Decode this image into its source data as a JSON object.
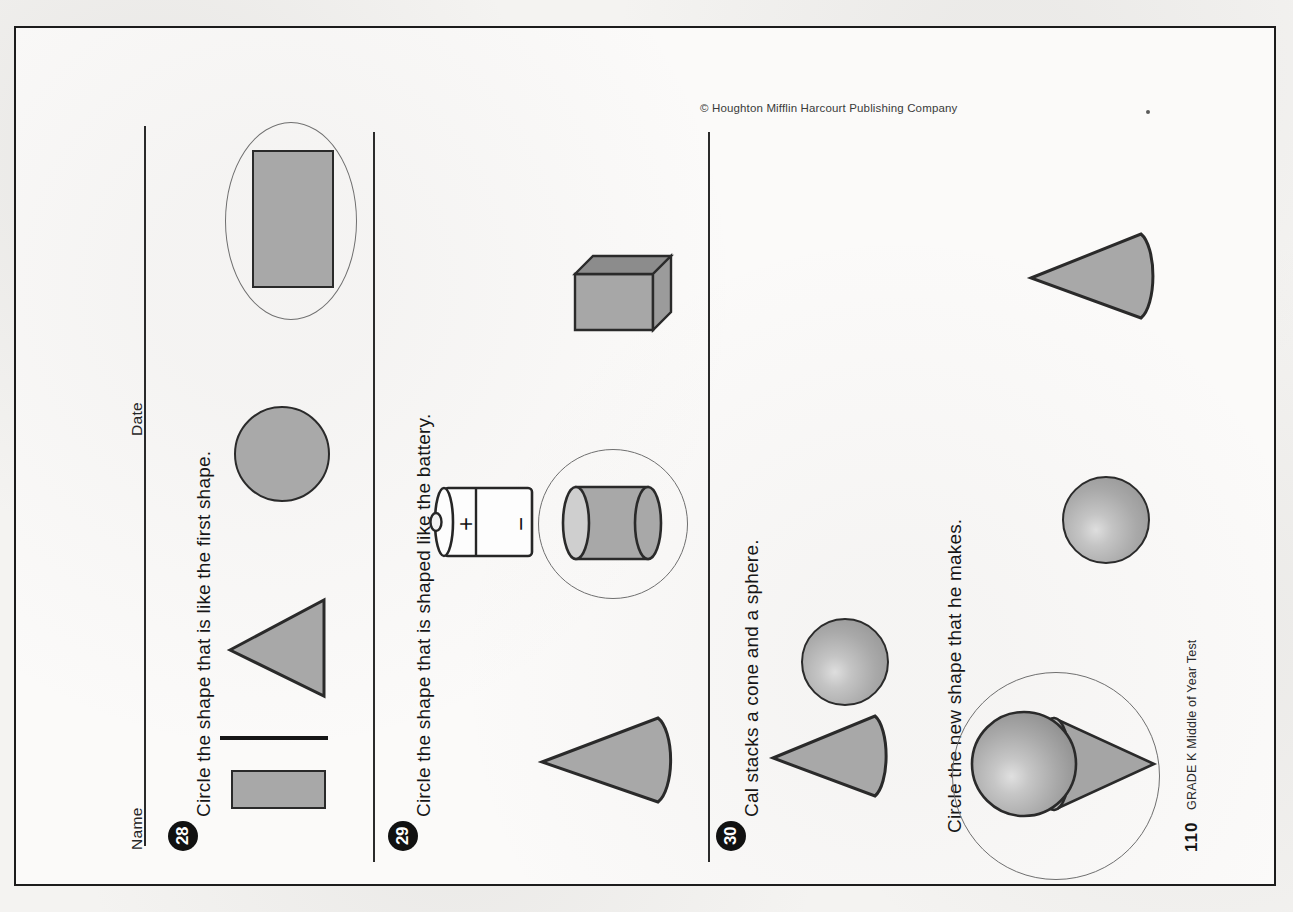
{
  "page": {
    "copyright": "© Houghton Mifflin Harcourt Publishing Company",
    "page_number": "110",
    "footer_label": "GRADE K Middle of Year Test",
    "orientation": "rotated-landscape-scan",
    "paper_color": "#fbfaf9",
    "ink_color": "#1b1b1b",
    "shape_fill_color": "#a8a8a8",
    "shape_outline_color": "#2a2a2a",
    "pencil_mark_color": "#6f6f6f"
  },
  "header": {
    "name_label": "Name",
    "date_label": "Date"
  },
  "items": [
    {
      "number": "28",
      "prompt": "Circle the shape that is like the first shape.",
      "given_shape": "rectangle",
      "answer_choices": [
        "rectangle",
        "circle",
        "triangle"
      ],
      "circled_answer": "rectangle"
    },
    {
      "number": "29",
      "prompt": "Circle the shape that is shaped like the battery.",
      "given_shape": "battery",
      "battery_plus": "+",
      "battery_minus": "−",
      "answer_choices": [
        "rectangular prism",
        "cylinder",
        "cone"
      ],
      "circled_answer": "cylinder"
    },
    {
      "number": "30",
      "prompt": "Cal stacks a cone and a sphere.",
      "prompt_line_2": "Circle the new shape that he makes.",
      "given_shapes": [
        "cone",
        "sphere"
      ],
      "answer_choices": [
        "cone",
        "sphere",
        "cone-and-sphere stacked"
      ],
      "circled_answer": "cone-and-sphere stacked"
    }
  ]
}
